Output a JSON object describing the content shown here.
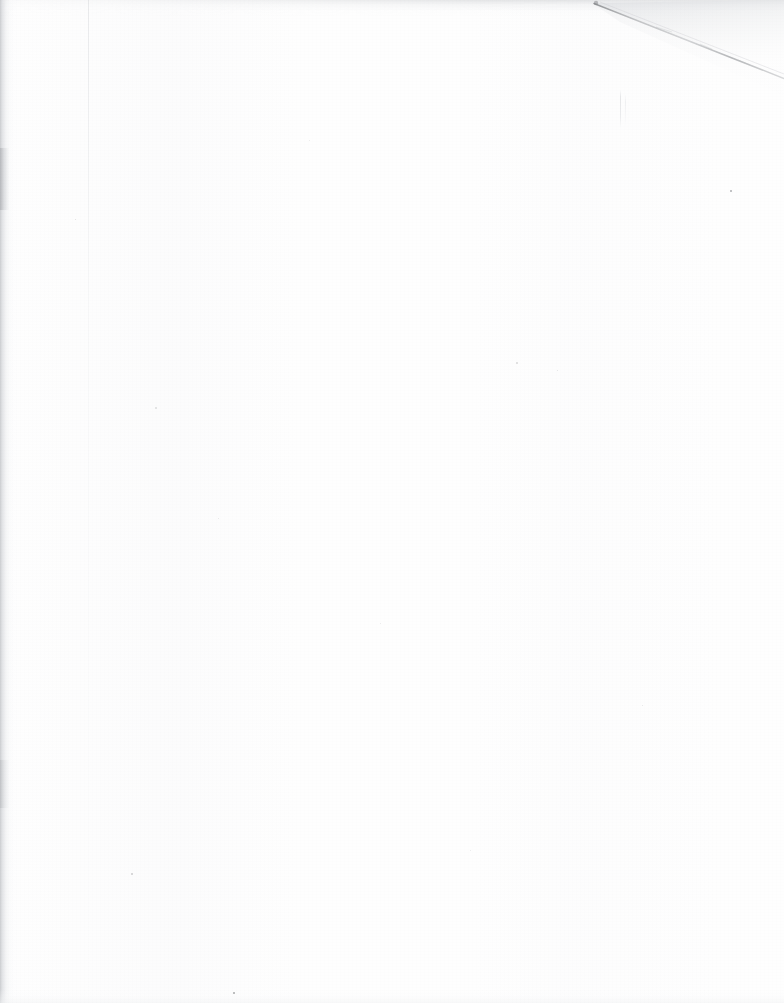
{
  "document": {
    "kind": "scanned-page",
    "content_text": "",
    "page_description": "Blank scanned page",
    "width_px": 784,
    "height_px": 1003
  },
  "colors": {
    "paper": "#fefefe",
    "page_background": "#ffffff",
    "spine_shadow": "#c6c8cb",
    "top_edge_band": "#cdcfd2",
    "fold_line": "#9a9c9f",
    "fold_shade": "#f0f1f2",
    "speck": "#6f7174"
  },
  "artifacts": {
    "corner_fold": {
      "name": "corner-fold-crease",
      "start_x": 595,
      "start_y": 3,
      "end_x": 784,
      "end_y": 78
    },
    "spine_shadow": {
      "name": "left-binding-shadow",
      "x": 0,
      "width": 14
    },
    "top_edge_band": {
      "name": "top-edge-smudge",
      "y": 0,
      "height": 16
    },
    "hairline": {
      "name": "faint-vertical-hairline",
      "x": 620,
      "y_start": 90,
      "y_end": 128
    },
    "specks": [
      {
        "x": 730,
        "y": 190,
        "size": 2.2,
        "opacity": 0.55
      },
      {
        "x": 233,
        "y": 992,
        "size": 2.0,
        "opacity": 0.6
      },
      {
        "x": 131,
        "y": 873,
        "size": 1.6,
        "opacity": 0.3
      },
      {
        "x": 516,
        "y": 362,
        "size": 1.5,
        "opacity": 0.22
      },
      {
        "x": 557,
        "y": 370,
        "size": 1.4,
        "opacity": 0.2
      },
      {
        "x": 75,
        "y": 219,
        "size": 1.4,
        "opacity": 0.22
      },
      {
        "x": 155,
        "y": 407,
        "size": 1.5,
        "opacity": 0.2
      },
      {
        "x": 218,
        "y": 518,
        "size": 1.3,
        "opacity": 0.18
      },
      {
        "x": 380,
        "y": 623,
        "size": 1.3,
        "opacity": 0.16
      },
      {
        "x": 642,
        "y": 705,
        "size": 1.4,
        "opacity": 0.18
      },
      {
        "x": 470,
        "y": 850,
        "size": 1.3,
        "opacity": 0.16
      },
      {
        "x": 309,
        "y": 140,
        "size": 1.3,
        "opacity": 0.15
      }
    ]
  }
}
